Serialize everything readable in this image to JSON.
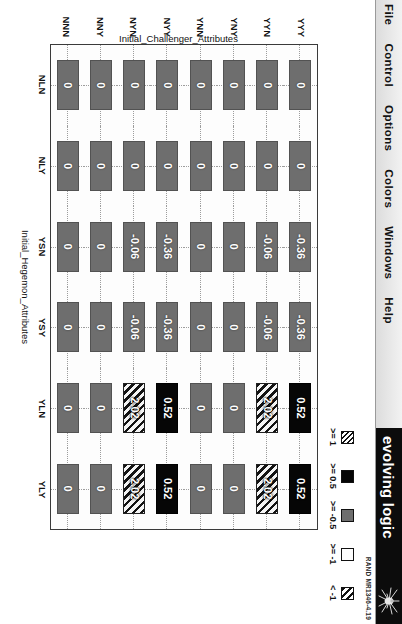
{
  "window": {
    "menu_items": [
      "File",
      "Control",
      "Options",
      "Colors",
      "Windows",
      "Help"
    ],
    "banner_text": "evolving logic",
    "rand_id": "RAND MR1346-4.19"
  },
  "legend": {
    "entries": [
      {
        "label": ">= 1",
        "style": "hatch-a"
      },
      {
        "label": ">= 0.5",
        "style": "black"
      },
      {
        "label": ">= -0.5",
        "style": "gray"
      },
      {
        "label": ">= -1",
        "style": "white"
      },
      {
        "label": "< -1",
        "style": "hatch-b"
      }
    ]
  },
  "chart_data": {
    "type": "heatmap",
    "title": "",
    "xlabel": "Initial_Hegemon_Attributes",
    "ylabel": "Initial_Challenger_Attributes",
    "grid": true,
    "legend_position": "top-right",
    "x_categories": [
      "NLN",
      "NLY",
      "YSN",
      "YSY",
      "YLN",
      "YLY"
    ],
    "y_categories": [
      "YYY",
      "YYN",
      "YNY",
      "YNN",
      "NYY",
      "NYN",
      "NNY",
      "NNN"
    ],
    "cells": [
      [
        {
          "value": "0",
          "bucket": "gray"
        },
        {
          "value": "0",
          "bucket": "gray"
        },
        {
          "value": "-0.36",
          "bucket": "gray"
        },
        {
          "value": "-0.36",
          "bucket": "gray"
        },
        {
          "value": "0.52",
          "bucket": "black"
        },
        {
          "value": "0.52",
          "bucket": "black"
        }
      ],
      [
        {
          "value": "0",
          "bucket": "gray"
        },
        {
          "value": "0",
          "bucket": "gray"
        },
        {
          "value": "-0.06",
          "bucket": "gray"
        },
        {
          "value": "-0.06",
          "bucket": "gray"
        },
        {
          "value": "2.02",
          "bucket": "hatch-a"
        },
        {
          "value": "2.02",
          "bucket": "hatch-a"
        }
      ],
      [
        {
          "value": "0",
          "bucket": "gray"
        },
        {
          "value": "0",
          "bucket": "gray"
        },
        {
          "value": "0",
          "bucket": "gray"
        },
        {
          "value": "0",
          "bucket": "gray"
        },
        {
          "value": "0",
          "bucket": "gray"
        },
        {
          "value": "0",
          "bucket": "gray"
        }
      ],
      [
        {
          "value": "0",
          "bucket": "gray"
        },
        {
          "value": "0",
          "bucket": "gray"
        },
        {
          "value": "0",
          "bucket": "gray"
        },
        {
          "value": "0",
          "bucket": "gray"
        },
        {
          "value": "0",
          "bucket": "gray"
        },
        {
          "value": "0",
          "bucket": "gray"
        }
      ],
      [
        {
          "value": "0",
          "bucket": "gray"
        },
        {
          "value": "0",
          "bucket": "gray"
        },
        {
          "value": "-0.36",
          "bucket": "gray"
        },
        {
          "value": "-0.36",
          "bucket": "gray"
        },
        {
          "value": "0.52",
          "bucket": "black"
        },
        {
          "value": "0.52",
          "bucket": "black"
        }
      ],
      [
        {
          "value": "0",
          "bucket": "gray"
        },
        {
          "value": "0",
          "bucket": "gray"
        },
        {
          "value": "-0.06",
          "bucket": "gray"
        },
        {
          "value": "-0.06",
          "bucket": "gray"
        },
        {
          "value": "2.02",
          "bucket": "hatch-a"
        },
        {
          "value": "2.02",
          "bucket": "hatch-a"
        }
      ],
      [
        {
          "value": "0",
          "bucket": "gray"
        },
        {
          "value": "0",
          "bucket": "gray"
        },
        {
          "value": "0",
          "bucket": "gray"
        },
        {
          "value": "0",
          "bucket": "gray"
        },
        {
          "value": "0",
          "bucket": "gray"
        },
        {
          "value": "0",
          "bucket": "gray"
        }
      ],
      [
        {
          "value": "0",
          "bucket": "gray"
        },
        {
          "value": "0",
          "bucket": "gray"
        },
        {
          "value": "0",
          "bucket": "gray"
        },
        {
          "value": "0",
          "bucket": "gray"
        },
        {
          "value": "0",
          "bucket": "gray"
        },
        {
          "value": "0",
          "bucket": "gray"
        }
      ]
    ]
  }
}
